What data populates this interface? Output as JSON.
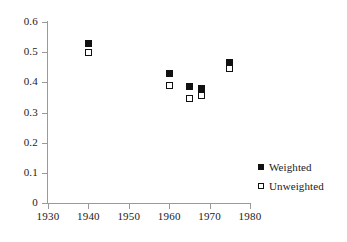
{
  "chart_data": {
    "type": "scatter",
    "title": "",
    "subtitle": "",
    "xlabel": "",
    "ylabel": "",
    "xlim": [
      1930,
      1980
    ],
    "ylim": [
      0,
      0.6
    ],
    "xticks": [
      1930,
      1940,
      1950,
      1960,
      1970,
      1980
    ],
    "yticks": [
      0,
      0.1,
      0.2,
      0.3,
      0.4,
      0.5,
      0.6
    ],
    "xtick_labels": [
      "1930",
      "1940",
      "1950",
      "1960",
      "1970",
      "1980"
    ],
    "ytick_labels": [
      "0",
      "0.1",
      "0.2",
      "0.3",
      "0.4",
      "0.5",
      "0.6"
    ],
    "grid": false,
    "legend_position": "right-lower",
    "series": [
      {
        "name": "Weighted",
        "marker": "filled-square",
        "color": "#111111",
        "x": [
          1940,
          1960,
          1965,
          1968,
          1975
        ],
        "y": [
          0.53,
          0.43,
          0.385,
          0.38,
          0.465
        ]
      },
      {
        "name": "Unweighted",
        "marker": "open-square",
        "color": "#111111",
        "x": [
          1940,
          1960,
          1965,
          1968,
          1975
        ],
        "y": [
          0.5,
          0.39,
          0.345,
          0.355,
          0.445
        ]
      }
    ]
  },
  "legend": {
    "items": [
      {
        "label": "Weighted",
        "marker": "filled-square"
      },
      {
        "label": "Unweighted",
        "marker": "open-square"
      }
    ]
  }
}
